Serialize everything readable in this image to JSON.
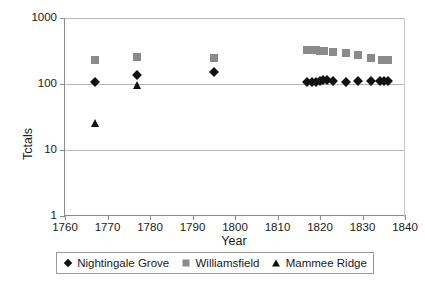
{
  "chart_data": {
    "type": "scatter",
    "title": "",
    "xlabel": "Year",
    "ylabel": "Tctals",
    "xlim": [
      1760,
      1840
    ],
    "ylim": [
      1,
      1000
    ],
    "yscale": "log",
    "xtick_labels": [
      "1760",
      "1770",
      "1780",
      "1790",
      "1800",
      "1810",
      "1820",
      "1830",
      "1840"
    ],
    "xticks": [
      1760,
      1770,
      1780,
      1790,
      1800,
      1810,
      1820,
      1830,
      1840
    ],
    "ytick_labels": [
      "1",
      "10",
      "100",
      "1000"
    ],
    "yticks": [
      1,
      10,
      100,
      1000
    ],
    "grid": "horizontal",
    "legend_position": "below",
    "series": [
      {
        "name": "Nightingale Grove",
        "marker": "diamond",
        "color": "#111111",
        "points": [
          {
            "x": 1767,
            "y": 108
          },
          {
            "x": 1777,
            "y": 138
          },
          {
            "x": 1795,
            "y": 150
          },
          {
            "x": 1817,
            "y": 106
          },
          {
            "x": 1818,
            "y": 107
          },
          {
            "x": 1819,
            "y": 108
          },
          {
            "x": 1820,
            "y": 110
          },
          {
            "x": 1820.8,
            "y": 114
          },
          {
            "x": 1821.6,
            "y": 113
          },
          {
            "x": 1823,
            "y": 111
          },
          {
            "x": 1826,
            "y": 106
          },
          {
            "x": 1829,
            "y": 110
          },
          {
            "x": 1832,
            "y": 111
          },
          {
            "x": 1834,
            "y": 111
          },
          {
            "x": 1835,
            "y": 112
          },
          {
            "x": 1836,
            "y": 112
          }
        ]
      },
      {
        "name": "Williamsfield",
        "marker": "square",
        "color": "#8a8a8a",
        "points": [
          {
            "x": 1767,
            "y": 230
          },
          {
            "x": 1777,
            "y": 255
          },
          {
            "x": 1795,
            "y": 245
          },
          {
            "x": 1817,
            "y": 330
          },
          {
            "x": 1818,
            "y": 330
          },
          {
            "x": 1819,
            "y": 325
          },
          {
            "x": 1820,
            "y": 320
          },
          {
            "x": 1821,
            "y": 318
          },
          {
            "x": 1823,
            "y": 305
          },
          {
            "x": 1826,
            "y": 295
          },
          {
            "x": 1829,
            "y": 278
          },
          {
            "x": 1832,
            "y": 245
          },
          {
            "x": 1834.5,
            "y": 232
          },
          {
            "x": 1836,
            "y": 232
          }
        ]
      },
      {
        "name": "Mammee Ridge",
        "marker": "triangle",
        "color": "#111111",
        "points": [
          {
            "x": 1767,
            "y": 26
          },
          {
            "x": 1777,
            "y": 97
          }
        ]
      }
    ]
  },
  "legend": {
    "entries": [
      {
        "label": "Nightingale Grove",
        "marker": "diamond"
      },
      {
        "label": "Williamsfield",
        "marker": "square"
      },
      {
        "label": "Mammee Ridge",
        "marker": "triangle"
      }
    ]
  }
}
